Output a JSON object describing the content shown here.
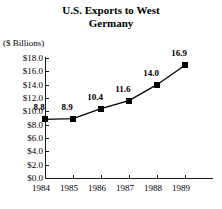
{
  "chart_data": {
    "type": "line",
    "title": "U.S. Exports to West Germany",
    "title_lines": [
      "U.S. Exports to West",
      "Germany"
    ],
    "ylabel": "($ Billions)",
    "xlabel": "",
    "categories": [
      "1984",
      "1985",
      "1986",
      "1987",
      "1988",
      "1989"
    ],
    "values": [
      8.8,
      8.9,
      10.4,
      11.6,
      14.0,
      16.9
    ],
    "value_labels": [
      "8.8",
      "8.9",
      "10.4",
      "11.6",
      "14.0",
      "16.9"
    ],
    "ylim": [
      0.0,
      18.0
    ],
    "ytick_values": [
      0.0,
      2.0,
      4.0,
      6.0,
      8.0,
      10.0,
      12.0,
      14.0,
      16.0,
      18.0
    ],
    "ytick_labels": [
      "$0.0",
      "$2.0",
      "$4.0",
      "$6.0",
      "$8.0",
      "$10.0",
      "$12.0",
      "$14.0",
      "$16.0",
      "$18.0"
    ],
    "grid": false,
    "legend": false,
    "marker": "square",
    "series_color": "#000000",
    "axis_color": "#1a1a1a"
  }
}
